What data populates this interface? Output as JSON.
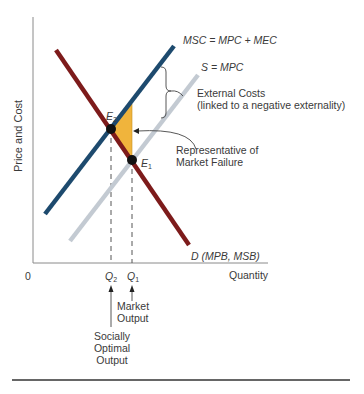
{
  "figure": {
    "y_axis_label": "Price and Cost",
    "x_axis_label": "Quantity",
    "origin_label": "0",
    "curves": {
      "msc": {
        "label": "MSC = MPC + MEC",
        "color": "#1d4a6e"
      },
      "supply": {
        "label": "S = MPC",
        "color": "#c3cad2"
      },
      "demand": {
        "label": "D (MPB, MSB)",
        "color": "#7d1b1b"
      }
    },
    "points": {
      "e2": {
        "letter": "E",
        "sub": "2"
      },
      "e1": {
        "letter": "E",
        "sub": "1"
      }
    },
    "quantities": {
      "q2": {
        "letter": "Q",
        "sub": "2"
      },
      "q1": {
        "letter": "Q",
        "sub": "1"
      }
    },
    "annotations": {
      "external_costs_line1": "External Costs",
      "external_costs_line2": "(linked to a negative externality)",
      "market_failure_line1": "Representative of",
      "market_failure_line2": "Market Failure",
      "market_output_line1": "Market",
      "market_output_line2": "Output",
      "socially_optimal_line1": "Socially",
      "socially_optimal_line2": "Optimal",
      "socially_optimal_line3": "Output"
    },
    "deadweight_fill_color": "#f0b43c"
  }
}
